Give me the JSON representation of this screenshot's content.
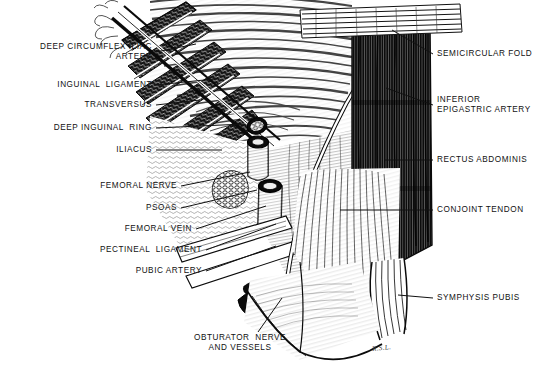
{
  "figure": {
    "signature": "R.S.L.",
    "background_color": "#ffffff",
    "ink_color": "#111111",
    "width": 539,
    "height": 384
  },
  "labels_left": [
    {
      "id": "deep-circumflex-iliac-artery",
      "lines": [
        "DEEP CIRCUMFLEX ILIAC",
        "ARTERY"
      ],
      "text": "DEEP CIRCUMFLEX ILIAC ARTERY",
      "x": 152,
      "y": 52,
      "align": "right",
      "leader_to_x": 196,
      "leader_to_y": 44
    },
    {
      "id": "inguinal-ligament",
      "lines": [
        "INGUINAL  LIGAMENT"
      ],
      "text": "INGUINAL LIGAMENT",
      "x": 152,
      "y": 85,
      "align": "right",
      "leader_to_x": 214,
      "leader_to_y": 79
    },
    {
      "id": "transversus",
      "lines": [
        "TRANSVERSUS"
      ],
      "text": "TRANSVERSUS",
      "x": 152,
      "y": 105,
      "align": "right",
      "leader_to_x": 200,
      "leader_to_y": 100
    },
    {
      "id": "deep-inguinal-ring",
      "lines": [
        "DEEP INGUINAL  RING"
      ],
      "text": "DEEP INGUINAL RING",
      "x": 152,
      "y": 128,
      "align": "right",
      "leader_to_x": 244,
      "leader_to_y": 124
    },
    {
      "id": "iliacus",
      "lines": [
        "ILIACUS"
      ],
      "text": "ILIACUS",
      "x": 152,
      "y": 150,
      "align": "right",
      "leader_to_x": 222,
      "leader_to_y": 150
    },
    {
      "id": "femoral-nerve",
      "lines": [
        "FEMORAL NERVE"
      ],
      "text": "FEMORAL NERVE",
      "x": 177,
      "y": 186,
      "align": "right",
      "leader_to_x": 250,
      "leader_to_y": 172
    },
    {
      "id": "psoas",
      "lines": [
        "PSOAS"
      ],
      "text": "PSOAS",
      "x": 177,
      "y": 208,
      "align": "right",
      "leader_to_x": 257,
      "leader_to_y": 190
    },
    {
      "id": "femoral-vein",
      "lines": [
        "FEMORAL VEIN"
      ],
      "text": "FEMORAL VEIN",
      "x": 192,
      "y": 229,
      "align": "right",
      "leader_to_x": 266,
      "leader_to_y": 206
    },
    {
      "id": "pectineal-ligament",
      "lines": [
        "PECTINEAL  LIGAMENT"
      ],
      "text": "PECTINEAL LIGAMENT",
      "x": 202,
      "y": 250,
      "align": "right",
      "leader_to_x": 276,
      "leader_to_y": 224
    },
    {
      "id": "pubic-artery",
      "lines": [
        "PUBIC ARTERY"
      ],
      "text": "PUBIC ARTERY",
      "x": 202,
      "y": 271,
      "align": "right",
      "leader_to_x": 276,
      "leader_to_y": 246
    }
  ],
  "labels_bottom": [
    {
      "id": "obturator-nerve-and-vessels",
      "lines": [
        "OBTURATOR  NERVE",
        "AND VESSELS"
      ],
      "text": "OBTURATOR NERVE AND VESSELS",
      "x": 240,
      "y": 343,
      "align": "center",
      "leader_to_x": 280,
      "leader_to_y": 300
    }
  ],
  "labels_right": [
    {
      "id": "semicircular-fold",
      "lines": [
        "SEMICIRCULAR FOLD"
      ],
      "text": "SEMICIRCULAR FOLD",
      "x": 437,
      "y": 54,
      "align": "left",
      "leader_to_x": 392,
      "leader_to_y": 30
    },
    {
      "id": "inferior-epigastric-artery",
      "lines": [
        "INFERIOR",
        "EPIGASTRIC ARTERY"
      ],
      "text": "INFERIOR EPIGASTRIC ARTERY",
      "x": 437,
      "y": 105,
      "align": "left",
      "leader_to_x": 386,
      "leader_to_y": 88
    },
    {
      "id": "rectus-abdominis",
      "lines": [
        "RECTUS ABDOMINIS"
      ],
      "text": "RECTUS ABDOMINIS",
      "x": 437,
      "y": 160,
      "align": "left",
      "leader_to_x": 385,
      "leader_to_y": 160
    },
    {
      "id": "conjoint-tendon",
      "lines": [
        "CONJOINT TENDON"
      ],
      "text": "CONJOINT TENDON",
      "x": 437,
      "y": 210,
      "align": "left",
      "leader_to_x": 340,
      "leader_to_y": 210
    },
    {
      "id": "symphysis-pubis",
      "lines": [
        "SYMPHYSIS PUBIS"
      ],
      "text": "SYMPHYSIS PUBIS",
      "x": 437,
      "y": 298,
      "align": "left",
      "leader_to_x": 398,
      "leader_to_y": 295
    }
  ]
}
